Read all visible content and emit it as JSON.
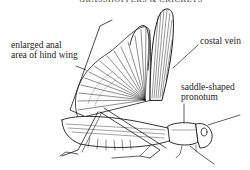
{
  "header": {
    "title": "GRASSHOPPERS & CRICKETS"
  },
  "diagram": {
    "subject": "grasshopper",
    "labels": [
      {
        "id": "anal-area",
        "text_line1": "enlarged anal",
        "text_line2": "area of hind wing"
      },
      {
        "id": "costal-vein",
        "text": "costal vein"
      },
      {
        "id": "pronotum",
        "text_line1": "saddle-shaped",
        "text_line2": "pronotum"
      }
    ]
  },
  "colors": {
    "ink": "#1a1a1a",
    "background": "#ffffff"
  }
}
